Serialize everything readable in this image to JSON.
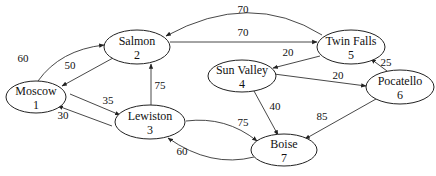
{
  "diagram": {
    "type": "directed-weighted-graph",
    "nodes": [
      {
        "id": "1",
        "name": "Moscow",
        "cx": 36,
        "cy": 97,
        "rx": 30,
        "ry": 16
      },
      {
        "id": "2",
        "name": "Salmon",
        "cx": 137,
        "cy": 47,
        "rx": 33,
        "ry": 17
      },
      {
        "id": "3",
        "name": "Lewiston",
        "cx": 150,
        "cy": 122,
        "rx": 35,
        "ry": 17
      },
      {
        "id": "4",
        "name": "Sun Valley",
        "cx": 242,
        "cy": 76,
        "rx": 34,
        "ry": 16
      },
      {
        "id": "5",
        "name": "Twin Falls",
        "cx": 351,
        "cy": 47,
        "rx": 34,
        "ry": 17
      },
      {
        "id": "6",
        "name": "Pocatello",
        "cx": 400,
        "cy": 87,
        "rx": 34,
        "ry": 17
      },
      {
        "id": "7",
        "name": "Boise",
        "cx": 284,
        "cy": 150,
        "rx": 33,
        "ry": 16
      }
    ],
    "edges": [
      {
        "from": "1",
        "to": "2",
        "weight": "60",
        "path": "M 38 81 Q 60 50 104 45",
        "lx": 23,
        "ly": 62
      },
      {
        "from": "2",
        "to": "1",
        "weight": "50",
        "path": "M 113 58 L 62 86",
        "lx": 70,
        "ly": 69
      },
      {
        "from": "1",
        "to": "3",
        "weight": "35",
        "path": "M 70 94 L 120 115",
        "lx": 108,
        "ly": 104
      },
      {
        "from": "3",
        "to": "1",
        "weight": "30",
        "path": "M 112 126 L 58 106",
        "lx": 63,
        "ly": 119
      },
      {
        "from": "3",
        "to": "2",
        "weight": "75",
        "path": "M 151 105 L 151 64",
        "lx": 160,
        "ly": 89
      },
      {
        "from": "5",
        "to": "2",
        "weight": "70",
        "path": "M 322 35 Q 250 -10 166 36",
        "lx": 243,
        "ly": 13
      },
      {
        "from": "2",
        "to": "5",
        "weight": "70",
        "path": "M 170 42 L 317 42",
        "lx": 243,
        "ly": 36
      },
      {
        "from": "5",
        "to": "4",
        "weight": "20",
        "path": "M 320 56 L 273 68",
        "lx": 288,
        "ly": 56
      },
      {
        "from": "4",
        "to": "6",
        "weight": "20",
        "path": "M 274 74 L 366 86",
        "lx": 338,
        "ly": 79
      },
      {
        "from": "6",
        "to": "5",
        "weight": "25",
        "path": "M 387 71 L 371 59",
        "lx": 386,
        "ly": 66
      },
      {
        "from": "4",
        "to": "7",
        "weight": "40",
        "path": "M 254 91 L 278 135",
        "lx": 275,
        "ly": 110
      },
      {
        "from": "6",
        "to": "7",
        "weight": "85",
        "path": "M 376 99 L 305 139",
        "lx": 322,
        "ly": 120
      },
      {
        "from": "3",
        "to": "7",
        "weight": "75",
        "path": "M 186 121 Q 226 116 257 141",
        "lx": 243,
        "ly": 126
      },
      {
        "from": "7",
        "to": "3",
        "weight": "60",
        "path": "M 254 157 Q 211 168 168 138",
        "lx": 182,
        "ly": 155
      }
    ]
  }
}
